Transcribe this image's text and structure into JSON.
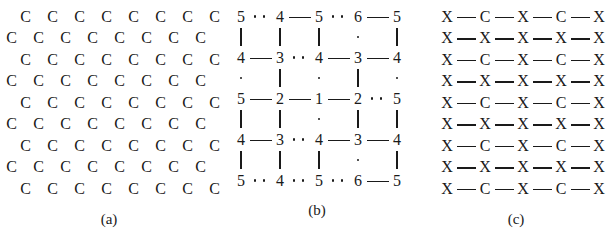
{
  "figure": {
    "panels": [
      {
        "id": "a",
        "caption": "(a)",
        "symbol": "C",
        "rows": [
          {
            "shift": true,
            "cells": [
              "C",
              "C",
              "C",
              "C",
              "C",
              "C",
              "C",
              "C"
            ]
          },
          {
            "shift": false,
            "cells": [
              "C",
              "C",
              "C",
              "C",
              "C",
              "C",
              "C",
              "C"
            ]
          },
          {
            "shift": true,
            "cells": [
              "C",
              "C",
              "C",
              "C",
              "C",
              "C",
              "C",
              "C"
            ]
          },
          {
            "shift": false,
            "cells": [
              "C",
              "C",
              "C",
              "C",
              "C",
              "C",
              "C",
              "C"
            ]
          },
          {
            "shift": true,
            "cells": [
              "C",
              "C",
              "C",
              "C",
              "C",
              "C",
              "C",
              "C"
            ]
          },
          {
            "shift": false,
            "cells": [
              "C",
              "C",
              "C",
              "C",
              "C",
              "C",
              "C",
              "C"
            ]
          },
          {
            "shift": true,
            "cells": [
              "C",
              "C",
              "C",
              "C",
              "C",
              "C",
              "C",
              "C"
            ]
          },
          {
            "shift": false,
            "cells": [
              "C",
              "C",
              "C",
              "C",
              "C",
              "C",
              "C",
              "C"
            ]
          },
          {
            "shift": true,
            "cells": [
              "C",
              "C",
              "C",
              "C",
              "C",
              "C",
              "C",
              "C"
            ]
          }
        ]
      },
      {
        "id": "b",
        "caption": "(b)",
        "node_rows": [
          {
            "nodes": [
              "5",
              "4",
              "5",
              "6",
              "5"
            ],
            "bonds": [
              "dotted",
              "solid",
              "dotted",
              "solid"
            ]
          },
          {
            "nodes": [
              "4",
              "3",
              "4",
              "3",
              "4"
            ],
            "bonds": [
              "solid",
              "dotted",
              "solid",
              "solid"
            ]
          },
          {
            "nodes": [
              "5",
              "2",
              "1",
              "2",
              "5"
            ],
            "bonds": [
              "solid",
              "solid",
              "solid",
              "dotted"
            ]
          },
          {
            "nodes": [
              "4",
              "3",
              "4",
              "3",
              "4"
            ],
            "bonds": [
              "solid",
              "dotted",
              "solid",
              "solid"
            ]
          },
          {
            "nodes": [
              "5",
              "4",
              "5",
              "6",
              "5"
            ],
            "bonds": [
              "dotted",
              "dotted",
              "dotted",
              "solid"
            ]
          }
        ],
        "link_rows": [
          [
            "solid",
            "solid",
            "solid",
            "dotted",
            "solid"
          ],
          [
            "dotted",
            "solid",
            "dotted",
            "solid",
            "dotted"
          ],
          [
            "solid",
            "solid",
            "dotted",
            "solid",
            "solid"
          ],
          [
            "solid",
            "solid",
            "solid",
            "dotted",
            "solid"
          ]
        ]
      },
      {
        "id": "c",
        "caption": "(c)",
        "rows": [
          {
            "atoms": [
              "X",
              "C",
              "X",
              "C",
              "X"
            ]
          },
          {
            "atoms": [
              "X",
              "X",
              "X",
              "X",
              "X"
            ]
          },
          {
            "atoms": [
              "X",
              "C",
              "X",
              "C",
              "X"
            ]
          },
          {
            "atoms": [
              "X",
              "X",
              "X",
              "X",
              "X"
            ]
          },
          {
            "atoms": [
              "X",
              "C",
              "X",
              "C",
              "X"
            ]
          },
          {
            "atoms": [
              "X",
              "X",
              "X",
              "X",
              "X"
            ]
          },
          {
            "atoms": [
              "X",
              "C",
              "X",
              "C",
              "X"
            ]
          },
          {
            "atoms": [
              "X",
              "X",
              "X",
              "X",
              "X"
            ]
          },
          {
            "atoms": [
              "X",
              "C",
              "X",
              "C",
              "X"
            ]
          }
        ]
      }
    ]
  }
}
